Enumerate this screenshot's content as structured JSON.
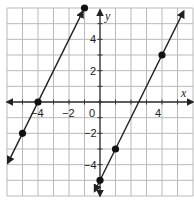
{
  "chart_data": {
    "type": "line",
    "title": "",
    "xlabel": "x",
    "ylabel": "y",
    "xlim": [
      -6,
      6
    ],
    "ylim": [
      -6,
      6
    ],
    "grid": true,
    "x_tick_labels": [
      {
        "value": -4,
        "label": "−4"
      },
      {
        "value": -2,
        "label": "−2"
      },
      {
        "value": 0,
        "label": "0"
      },
      {
        "value": 4,
        "label": "4"
      }
    ],
    "y_tick_labels": [
      {
        "value": 4,
        "label": "4"
      },
      {
        "value": 2,
        "label": "2"
      },
      {
        "value": -2,
        "label": "−2"
      },
      {
        "value": -4,
        "label": "−4"
      }
    ],
    "series": [
      {
        "name": "line-1",
        "slope": 2,
        "intercept": 8,
        "points": [
          {
            "x": -5,
            "y": -2
          },
          {
            "x": -4,
            "y": 0
          },
          {
            "x": -1,
            "y": 6
          }
        ]
      },
      {
        "name": "line-2",
        "slope": 2,
        "intercept": -5,
        "points": [
          {
            "x": 0,
            "y": -5
          },
          {
            "x": 1,
            "y": -3
          },
          {
            "x": 4,
            "y": 3
          }
        ]
      }
    ]
  },
  "colors": {
    "grid": "#b9b9b9",
    "axis": "#333333",
    "line": "#222222",
    "point": "#111111"
  }
}
